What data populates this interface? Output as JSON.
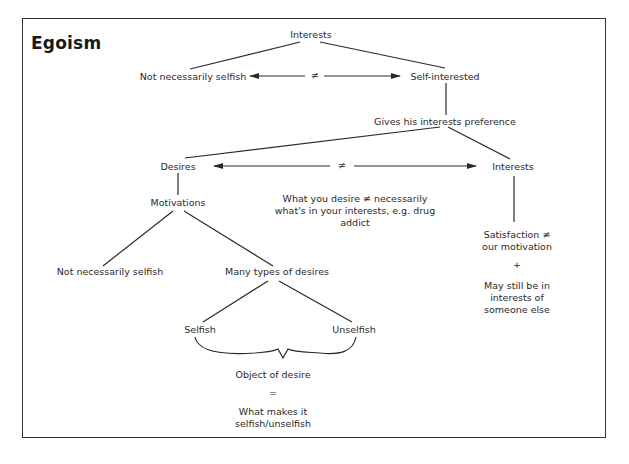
{
  "title": "Egoism",
  "nodes": {
    "interests_top": "Interests",
    "not_necessarily_selfish_top": "Not necessarily selfish",
    "self_interested": "Self-interested",
    "gives_preference": "Gives his interests preference",
    "desires": "Desires",
    "interests_right": "Interests",
    "motivations": "Motivations",
    "desire_note_line1": "What you desire ≠ necessarily",
    "desire_note_line2": "what's in your interests, e.g. drug",
    "desire_note_line3": "addict",
    "satisfaction_line1": "Satisfaction ≠",
    "satisfaction_line2": "our motivation",
    "plus": "+",
    "may_still_line1": "May still be in",
    "may_still_line2": "interests of",
    "may_still_line3": "someone else",
    "not_necessarily_selfish_bottom": "Not necessarily selfish",
    "many_types": "Many types of desires",
    "selfish": "Selfish",
    "unselfish": "Unselfish",
    "object_of_desire": "Object of desire",
    "equals": "=",
    "what_makes_line1": "What makes it",
    "what_makes_line2": "selfish/unselfish"
  },
  "connectors": {
    "neq_top": "≠",
    "neq_middle": "≠"
  },
  "colors": {
    "line": "#2a2a2a",
    "text": "#2a2a2a",
    "background": "#ffffff"
  }
}
